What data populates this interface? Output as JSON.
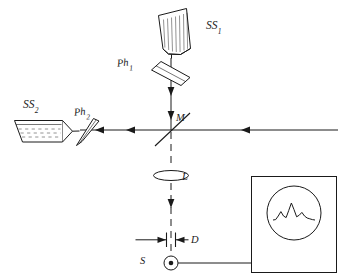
{
  "figure": {
    "kind": "optical-interferometer-schematic",
    "background_color": "#ffffff",
    "line_color": "#1a1a1a"
  },
  "labels": {
    "sample_cell_1": {
      "base": "SS",
      "sub": "1",
      "name": "SS1"
    },
    "sample_cell_2": {
      "base": "SS",
      "sub": "2",
      "name": "SS2"
    },
    "phase_plate_1": {
      "base": "Ph",
      "sub": "1",
      "name": "Ph1"
    },
    "phase_plate_2": {
      "base": "Ph",
      "sub": "2",
      "name": "Ph2"
    },
    "beamsplitter": {
      "base": "M",
      "sub": "",
      "name": "M"
    },
    "lens": {
      "base": "L",
      "sub": "",
      "name": "L"
    },
    "aperture": {
      "base": "D",
      "sub": "",
      "name": "D"
    },
    "detector": {
      "base": "S",
      "sub": "",
      "name": "S"
    }
  },
  "components": {
    "ss1": {
      "label": "SS1",
      "description": "tilted hatched sample cell, upper branch"
    },
    "ss2": {
      "label": "SS2",
      "description": "horizontal hatched sample cell with pointed nose, left branch"
    },
    "ph1": {
      "label": "Ph1",
      "description": "tilted phase plate in vertical beam"
    },
    "ph2": {
      "label": "Ph2",
      "description": "tilted phase plate in horizontal beam"
    },
    "m": {
      "label": "M",
      "description": "beam splitter at beam crossing"
    },
    "l": {
      "label": "L",
      "description": "converging lens below beam splitter"
    },
    "d": {
      "label": "D",
      "description": "aperture / slit above detector"
    },
    "s": {
      "label": "S",
      "description": "photodetector, circle with center dot"
    },
    "oscilloscope": {
      "description": "display box with round screen showing interference trace"
    }
  },
  "beams": {
    "incoming_right": {
      "style": "solid",
      "arrow": "left"
    },
    "vertical_upper": {
      "style": "solid",
      "arrow": "down"
    },
    "horizontal_left": {
      "style": "solid",
      "arrow": "left"
    },
    "vertical_lower": {
      "style": "dashed",
      "arrow": "down"
    }
  },
  "chart_data": {
    "type": "line",
    "title": "",
    "xlabel": "",
    "ylabel": "",
    "grid": false,
    "legend": "none",
    "x": [
      0,
      1,
      2,
      3,
      4,
      5,
      6,
      7,
      8,
      9,
      10,
      11,
      12,
      13,
      14,
      15,
      16
    ],
    "values": [
      0.1,
      0.12,
      0.3,
      0.52,
      0.3,
      0.22,
      0.58,
      0.95,
      0.62,
      0.26,
      0.34,
      0.48,
      0.3,
      0.2,
      0.16,
      0.12,
      0.1
    ],
    "xlim": [
      0,
      16
    ],
    "ylim": [
      0,
      1
    ]
  }
}
